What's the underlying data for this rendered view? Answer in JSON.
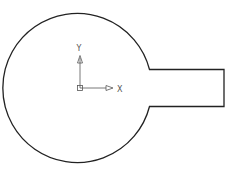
{
  "drawing": {
    "description": "Circle with rectangular tab (keyhole-like profile)",
    "stroke_color": "#222222",
    "ucs_color": "#555555"
  },
  "ucs_icon": {
    "x_label": "X",
    "y_label": "Y"
  }
}
